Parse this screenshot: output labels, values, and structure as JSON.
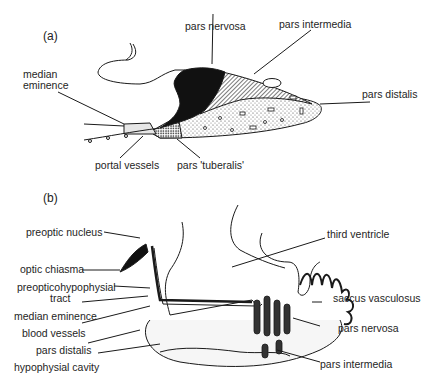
{
  "figure": {
    "panels": [
      {
        "id": "a",
        "tag": "(a)",
        "labels": {
          "pars_nervosa": "pars nervosa",
          "pars_intermedia": "pars intermedia",
          "median_eminence_1": "median",
          "median_eminence_2": "eminence",
          "pars_distalis": "pars distalis",
          "portal_vessels": "portal vessels",
          "pars_tuberalis": "pars 'tuberalis'"
        }
      },
      {
        "id": "b",
        "tag": "(b)",
        "labels": {
          "preoptic_nucleus": "preoptic nucleus",
          "third_ventricle": "third ventricle",
          "optic_chiasma": "optic chiasma",
          "preopticohypophysial_tract_1": "preopticohypophysial",
          "preopticohypophysial_tract_2": "tract",
          "saccus_vasculosus": "saccus vasculosus",
          "median_eminence": "median eminence",
          "blood_vessels": "blood vessels",
          "pars_nervosa": "pars nervosa",
          "pars_distalis": "pars distalis",
          "hypophysial_cavity": "hypophysial cavity",
          "pars_intermedia": "pars intermedia"
        }
      }
    ],
    "colors": {
      "ink": "#1a1a1a",
      "background": "#ffffff",
      "stipple": "#cfcfcf"
    }
  }
}
